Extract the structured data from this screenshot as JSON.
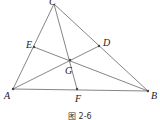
{
  "figure": {
    "points": {
      "A": {
        "label": "A",
        "x": 13,
        "y": 89
      },
      "B": {
        "label": "B",
        "x": 148,
        "y": 91
      },
      "C": {
        "label": "C",
        "x": 54,
        "y": 4
      },
      "D": {
        "label": "D",
        "x": 99,
        "y": 46
      },
      "E": {
        "label": "E",
        "x": 34,
        "y": 47
      },
      "F": {
        "label": "F",
        "x": 77,
        "y": 89
      },
      "G": {
        "label": "G",
        "x": 70,
        "y": 60
      }
    },
    "segments": [
      [
        "A",
        "B"
      ],
      [
        "B",
        "C"
      ],
      [
        "C",
        "A"
      ],
      [
        "A",
        "D"
      ],
      [
        "B",
        "E"
      ],
      [
        "C",
        "F"
      ]
    ],
    "caption": "图 2-6",
    "line_color": "#555555"
  }
}
